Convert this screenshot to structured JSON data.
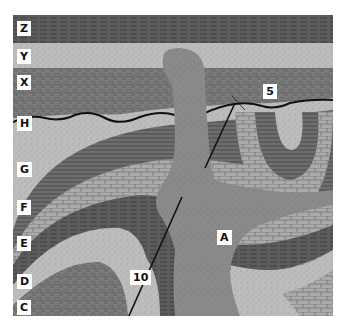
{
  "diagram": {
    "type": "geologic-cross-section",
    "layers": [
      {
        "id": "Z",
        "label": "Z",
        "pattern": "dark-shale",
        "color": "#5a5a5a"
      },
      {
        "id": "Y",
        "label": "Y",
        "pattern": "light-sandstone",
        "color": "#bdbdbd"
      },
      {
        "id": "X",
        "label": "X",
        "pattern": "conglomerate",
        "color": "#7d7d7d"
      },
      {
        "id": "H",
        "label": "H",
        "pattern": "light-sandstone",
        "color": "#bebebe"
      },
      {
        "id": "G",
        "label": "G",
        "pattern": "shale-lines",
        "color": "#6a6a6a"
      },
      {
        "id": "F",
        "label": "F",
        "pattern": "limestone-blocks",
        "color": "#a9a9a9"
      },
      {
        "id": "E",
        "label": "E",
        "pattern": "dark-shale",
        "color": "#5e5e5e"
      },
      {
        "id": "D",
        "label": "D",
        "pattern": "light-sandstone",
        "color": "#b5b5b5"
      },
      {
        "id": "C",
        "label": "C",
        "pattern": "conglomerate",
        "color": "#808080"
      }
    ],
    "intrusion": {
      "id": "A",
      "label": "A",
      "color": "#8a8a8a"
    },
    "faults": [
      {
        "id": "5",
        "label": "5"
      },
      {
        "id": "10",
        "label": "10"
      }
    ],
    "unconformity": "wavy black line between X and H"
  }
}
